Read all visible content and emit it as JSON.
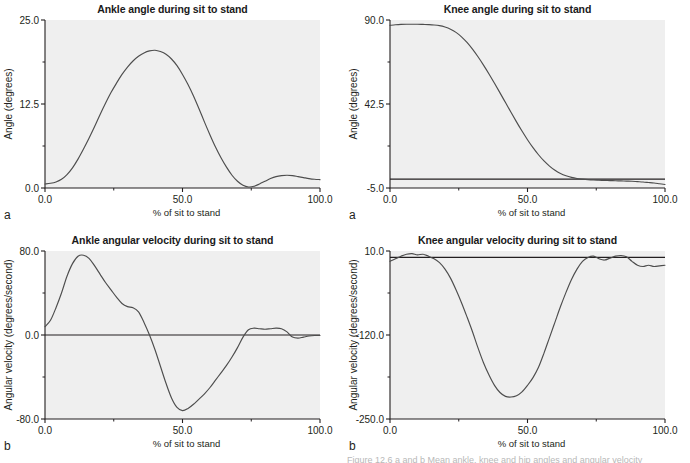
{
  "figure": {
    "background": "#ffffff",
    "plot_background": "#efefef",
    "line_color": "#4d4d4d",
    "axis_color": "#231f20",
    "caption_fragment": "Figure 12.6  a  and  b  Mean ankle, knee and hip angles and angular velocity"
  },
  "panels": [
    {
      "letter": "a",
      "position": "top-left"
    },
    {
      "letter": "a",
      "position": "top-right"
    },
    {
      "letter": "b",
      "position": "bottom-left"
    },
    {
      "letter": "b",
      "position": "bottom-right"
    }
  ],
  "chart_data": [
    {
      "id": "ankle-angle",
      "type": "line",
      "title": "Ankle angle during sit to stand",
      "xlabel": "% of sit to stand",
      "ylabel": "Angle (degrees)",
      "xlim": [
        0.0,
        100.0
      ],
      "ylim": [
        0.0,
        25.0
      ],
      "xticks": [
        0.0,
        50.0,
        100.0
      ],
      "xtick_labels": [
        "0.0",
        "50.0",
        "100.0"
      ],
      "yticks": [
        0.0,
        12.5,
        25.0
      ],
      "ytick_labels": [
        "0.0",
        "12.5",
        "25.0"
      ],
      "minor_yticks": [
        6.25,
        18.75
      ],
      "minor_xticks": [
        25.0,
        75.0
      ],
      "grid": false,
      "legend": "none",
      "zero_line": false,
      "x": [
        0,
        2,
        4,
        6,
        8,
        10,
        12,
        14,
        16,
        18,
        20,
        22,
        24,
        26,
        28,
        30,
        32,
        34,
        36,
        38,
        40,
        42,
        44,
        46,
        48,
        50,
        52,
        54,
        56,
        58,
        60,
        62,
        64,
        66,
        68,
        70,
        72,
        74,
        76,
        78,
        80,
        82,
        84,
        86,
        88,
        90,
        92,
        94,
        96,
        98,
        100
      ],
      "y": [
        0.6,
        0.7,
        0.9,
        1.3,
        2.0,
        3.0,
        4.3,
        5.8,
        7.4,
        9.1,
        10.9,
        12.6,
        14.2,
        15.6,
        16.9,
        18.0,
        18.9,
        19.6,
        20.1,
        20.4,
        20.5,
        20.3,
        19.9,
        19.2,
        18.2,
        16.9,
        15.4,
        13.7,
        11.8,
        9.8,
        7.9,
        6.1,
        4.5,
        3.1,
        1.9,
        1.0,
        0.4,
        0.15,
        0.25,
        0.6,
        1.0,
        1.4,
        1.7,
        1.85,
        1.9,
        1.85,
        1.7,
        1.55,
        1.4,
        1.3,
        1.25
      ]
    },
    {
      "id": "knee-angle",
      "type": "line",
      "title": "Knee angle during sit to stand",
      "xlabel": "% of sit to stand",
      "ylabel": "Angle (degrees)",
      "xlim": [
        0.0,
        100.0
      ],
      "ylim": [
        -5.0,
        90.0
      ],
      "xticks": [
        0.0,
        50.0,
        100.0
      ],
      "xtick_labels": [
        "0.0",
        "50.0",
        "100.0"
      ],
      "yticks": [
        -5.0,
        42.5,
        90.0
      ],
      "ytick_labels": [
        "-5.0",
        "42.5",
        "90.0"
      ],
      "minor_yticks": [
        18.75,
        66.25
      ],
      "minor_xticks": [
        25.0,
        75.0
      ],
      "grid": false,
      "legend": "none",
      "zero_line": true,
      "zero_line_value": 0.0,
      "x": [
        0,
        2,
        4,
        6,
        8,
        10,
        12,
        14,
        16,
        18,
        20,
        22,
        24,
        26,
        28,
        30,
        32,
        34,
        36,
        38,
        40,
        42,
        44,
        46,
        48,
        50,
        52,
        54,
        56,
        58,
        60,
        62,
        64,
        66,
        68,
        70,
        72,
        74,
        76,
        78,
        80,
        82,
        84,
        86,
        88,
        90,
        92,
        94,
        96,
        98,
        100
      ],
      "y": [
        87.0,
        87.3,
        87.5,
        87.6,
        87.6,
        87.6,
        87.5,
        87.4,
        87.2,
        86.8,
        86.0,
        84.8,
        83.0,
        80.5,
        77.3,
        73.5,
        69.2,
        64.5,
        59.5,
        54.2,
        48.8,
        43.3,
        37.8,
        32.4,
        27.2,
        22.3,
        17.8,
        13.8,
        10.3,
        7.4,
        5.0,
        3.2,
        1.9,
        1.0,
        0.4,
        0.0,
        -0.3,
        -0.5,
        -0.6,
        -0.7,
        -0.8,
        -0.9,
        -1.0,
        -1.1,
        -1.2,
        -1.4,
        -1.6,
        -1.9,
        -2.2,
        -2.6,
        -3.0
      ]
    },
    {
      "id": "ankle-angular-velocity",
      "type": "line",
      "title": "Ankle angular velocity during sit to stand",
      "xlabel": "% of sit to stand",
      "ylabel": "Angular velocity (degrees/second)",
      "xlim": [
        0.0,
        100.0
      ],
      "ylim": [
        -80.0,
        80.0
      ],
      "xticks": [
        0.0,
        50.0,
        100.0
      ],
      "xtick_labels": [
        "0.0",
        "50.0",
        "100.0"
      ],
      "yticks": [
        -80.0,
        0.0,
        80.0
      ],
      "ytick_labels": [
        "-80.0",
        "0.0",
        "80.0"
      ],
      "minor_yticks": [
        -40.0,
        40.0
      ],
      "minor_xticks": [
        25.0,
        75.0
      ],
      "grid": false,
      "legend": "none",
      "zero_line": true,
      "zero_line_value": 0.0,
      "x": [
        0,
        2,
        4,
        6,
        8,
        10,
        12,
        14,
        16,
        18,
        20,
        22,
        24,
        26,
        28,
        30,
        32,
        34,
        36,
        38,
        40,
        42,
        44,
        46,
        48,
        50,
        52,
        54,
        56,
        58,
        60,
        62,
        64,
        66,
        68,
        70,
        72,
        74,
        76,
        78,
        80,
        82,
        84,
        86,
        88,
        90,
        92,
        94,
        96,
        98,
        100
      ],
      "y": [
        8.0,
        14.0,
        26.0,
        40.0,
        56.0,
        68.0,
        75.0,
        76.0,
        73.0,
        66.0,
        58.0,
        50.0,
        43.0,
        36.0,
        30.0,
        27.0,
        26.0,
        22.0,
        12.0,
        0.0,
        -14.0,
        -30.0,
        -46.0,
        -60.0,
        -69.0,
        -72.0,
        -70.0,
        -66.0,
        -61.0,
        -56.0,
        -50.0,
        -43.0,
        -36.0,
        -29.0,
        -21.0,
        -12.0,
        -2.0,
        5.0,
        6.5,
        6.0,
        5.5,
        6.0,
        6.5,
        6.0,
        3.0,
        -2.0,
        -3.0,
        -2.0,
        -1.0,
        -0.5,
        -0.5
      ]
    },
    {
      "id": "knee-angular-velocity",
      "type": "line",
      "title": "Knee angular velocity during sit to stand",
      "xlabel": "% of sit to stand",
      "ylabel": "Angular velocity (degrees/second)",
      "xlim": [
        0.0,
        100.0
      ],
      "ylim": [
        -250.0,
        10.0
      ],
      "xticks": [
        0.0,
        50.0,
        100.0
      ],
      "xtick_labels": [
        "0.0",
        "50.0",
        "100.0"
      ],
      "yticks": [
        -250.0,
        -120.0,
        10.0
      ],
      "ytick_labels": [
        "-250.0",
        "-120.0",
        "10.0"
      ],
      "minor_yticks": [
        -185.0,
        -55.0
      ],
      "minor_xticks": [
        25.0,
        75.0
      ],
      "grid": false,
      "legend": "none",
      "zero_line": true,
      "zero_line_value": 0.0,
      "x": [
        0,
        2,
        4,
        6,
        8,
        10,
        12,
        14,
        16,
        18,
        20,
        22,
        24,
        26,
        28,
        30,
        32,
        34,
        36,
        38,
        40,
        42,
        44,
        46,
        48,
        50,
        52,
        54,
        56,
        58,
        60,
        62,
        64,
        66,
        68,
        70,
        72,
        74,
        76,
        78,
        80,
        82,
        84,
        86,
        88,
        90,
        92,
        94,
        96,
        98,
        100
      ],
      "y": [
        -6.0,
        -2.0,
        2.0,
        5.0,
        6.0,
        4.0,
        5.0,
        2.0,
        -2.0,
        -8.0,
        -18.0,
        -32.0,
        -50.0,
        -70.0,
        -92.0,
        -115.0,
        -140.0,
        -163.0,
        -182.0,
        -198.0,
        -209.0,
        -215.0,
        -216.0,
        -214.0,
        -208.0,
        -198.0,
        -186.0,
        -170.0,
        -148.0,
        -124.0,
        -100.0,
        -76.0,
        -54.0,
        -34.0,
        -18.0,
        -6.0,
        0.0,
        2.0,
        -2.0,
        -4.0,
        -1.0,
        2.0,
        3.0,
        1.0,
        -6.0,
        -12.0,
        -14.0,
        -12.0,
        -14.0,
        -13.0,
        -12.0
      ]
    }
  ]
}
